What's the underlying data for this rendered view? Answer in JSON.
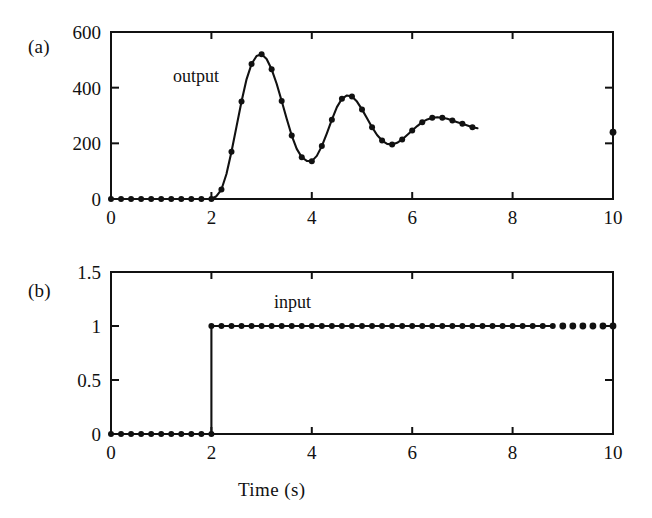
{
  "figure": {
    "background": "#ffffff",
    "ink": "#111111",
    "width": 652,
    "height": 518
  },
  "panels": {
    "a": {
      "tag": "(a)",
      "series_label": "output"
    },
    "b": {
      "tag": "(b)",
      "series_label": "input"
    }
  },
  "shared": {
    "xlabel": "Time (s)"
  },
  "chart_data": [
    {
      "id": "panel-a",
      "type": "line",
      "title": "",
      "subtitle": "(a)",
      "xlabel": "",
      "ylabel": "",
      "xlim": [
        0,
        10
      ],
      "ylim": [
        0,
        600
      ],
      "xticks": [
        0,
        2,
        4,
        6,
        8,
        10
      ],
      "xticklabels": [
        "0",
        "2",
        "4",
        "6",
        "8",
        "10"
      ],
      "yticks": [
        0,
        200,
        400,
        600
      ],
      "yticklabels": [
        "0",
        "200",
        "400",
        "600"
      ],
      "grid": false,
      "legend": "none",
      "annotations": [
        {
          "text": "output",
          "x": 1.6,
          "y": 430
        },
        {
          "text": "(a)",
          "x": -1.2,
          "y": 540
        }
      ],
      "marker": "filled-circle",
      "line_ends_at_x": 7.3,
      "series": [
        {
          "name": "output",
          "x": [
            0.0,
            0.2,
            0.4,
            0.6,
            0.8,
            1.0,
            1.2,
            1.4,
            1.6,
            1.8,
            2.0,
            2.1,
            2.2,
            2.3,
            2.4,
            2.5,
            2.6,
            2.7,
            2.8,
            2.9,
            3.0,
            3.1,
            3.2,
            3.3,
            3.4,
            3.5,
            3.6,
            3.7,
            3.8,
            3.9,
            4.0,
            4.1,
            4.2,
            4.3,
            4.4,
            4.5,
            4.6,
            4.7,
            4.8,
            4.9,
            5.0,
            5.1,
            5.2,
            5.3,
            5.4,
            5.5,
            5.6,
            5.7,
            5.8,
            5.9,
            6.0,
            6.1,
            6.2,
            6.3,
            6.4,
            6.5,
            6.6,
            6.7,
            6.8,
            6.9,
            7.0,
            7.1,
            7.2,
            7.3,
            7.5,
            7.7,
            7.9,
            8.1,
            8.3,
            8.5,
            8.7,
            8.9,
            9.1,
            9.3,
            9.5,
            9.7,
            9.9,
            10.0
          ],
          "y": [
            0,
            0,
            0,
            0,
            0,
            0,
            0,
            0,
            0,
            0,
            0,
            10,
            34,
            90,
            170,
            260,
            350,
            430,
            485,
            514,
            520,
            503,
            466,
            414,
            352,
            288,
            228,
            180,
            150,
            137,
            136,
            155,
            190,
            236,
            285,
            330,
            360,
            372,
            368,
            350,
            322,
            290,
            258,
            230,
            210,
            198,
            196,
            202,
            214,
            230,
            246,
            262,
            276,
            286,
            292,
            294,
            292,
            288,
            282,
            276,
            270,
            264,
            258,
            254,
            248,
            238,
            232,
            230,
            232,
            238,
            246,
            252,
            254,
            252,
            248,
            244,
            240,
            240
          ]
        }
      ]
    },
    {
      "id": "panel-b",
      "type": "line",
      "title": "",
      "subtitle": "(b)",
      "xlabel": "Time (s)",
      "ylabel": "",
      "xlim": [
        0,
        10
      ],
      "ylim": [
        0,
        1.5
      ],
      "xticks": [
        0,
        2,
        4,
        6,
        8,
        10
      ],
      "xticklabels": [
        "0",
        "2",
        "4",
        "6",
        "8",
        "10"
      ],
      "yticks": [
        0,
        0.5,
        1,
        1.5
      ],
      "yticklabels": [
        "0",
        "0.5",
        "1",
        "1.5"
      ],
      "grid": false,
      "legend": "none",
      "annotations": [
        {
          "text": "input",
          "x": 3.3,
          "y": 1.24
        },
        {
          "text": "(b)",
          "x": -1.2,
          "y": 1.38
        }
      ],
      "marker": "filled-circle",
      "line_ends_at_x": 8.8,
      "series": [
        {
          "name": "input",
          "x": [
            0.0,
            0.2,
            0.4,
            0.6,
            0.8,
            1.0,
            1.2,
            1.4,
            1.6,
            1.8,
            2.0,
            2.0,
            2.2,
            2.4,
            2.6,
            2.8,
            3.0,
            3.2,
            3.4,
            3.6,
            3.8,
            4.0,
            4.2,
            4.4,
            4.6,
            4.8,
            5.0,
            5.2,
            5.4,
            5.6,
            5.8,
            6.0,
            6.2,
            6.4,
            6.6,
            6.8,
            7.0,
            7.2,
            7.4,
            7.6,
            7.8,
            8.0,
            8.2,
            8.4,
            8.6,
            8.8,
            9.0,
            9.2,
            9.4,
            9.6,
            9.8,
            10.0
          ],
          "y": [
            0,
            0,
            0,
            0,
            0,
            0,
            0,
            0,
            0,
            0,
            0,
            1,
            1,
            1,
            1,
            1,
            1,
            1,
            1,
            1,
            1,
            1,
            1,
            1,
            1,
            1,
            1,
            1,
            1,
            1,
            1,
            1,
            1,
            1,
            1,
            1,
            1,
            1,
            1,
            1,
            1,
            1,
            1,
            1,
            1,
            1,
            1,
            1,
            1,
            1,
            1,
            1
          ]
        }
      ]
    }
  ]
}
